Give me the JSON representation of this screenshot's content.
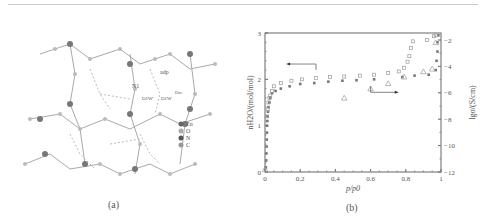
{
  "figure": {
    "panel_a": {
      "caption": "(a)",
      "labels": {
        "adp": "adp",
        "n1": "N1",
        "o1w_prime": "O1W'",
        "o1w": "O1W",
        "ow": "Ow"
      },
      "legend": [
        {
          "label": "Zn",
          "color": "#666"
        },
        {
          "label": "O",
          "color": "#aaa"
        },
        {
          "label": "N",
          "color": "#555"
        },
        {
          "label": "C",
          "color": "#999"
        }
      ]
    },
    "panel_b": {
      "caption": "(b)"
    }
  },
  "chart_data": {
    "type": "scatter",
    "title": "",
    "xlabel": "p/p0",
    "ylabel": "nH2O/(mol/mol)",
    "ylabel_right": "lgσ/(S/cm)",
    "xlim": [
      0,
      1
    ],
    "ylim": [
      0,
      3
    ],
    "ylim_right": [
      -12,
      -2
    ],
    "x_ticks": [
      "0",
      "0.2",
      "0.4",
      "0.6",
      "0.8",
      "1"
    ],
    "y_ticks": [
      "0",
      "1",
      "2",
      "3"
    ],
    "y_right_ticks": [
      "-2",
      "-4",
      "-6",
      "-8",
      "-10",
      "-12"
    ],
    "grid": false,
    "series": [
      {
        "name": "adsorption (filled squares)",
        "axis": "left",
        "marker": "filled-square",
        "x": [
          0.005,
          0.007,
          0.008,
          0.009,
          0.01,
          0.011,
          0.012,
          0.013,
          0.015,
          0.017,
          0.02,
          0.025,
          0.03,
          0.04,
          0.06,
          0.09,
          0.14,
          0.2,
          0.28,
          0.36,
          0.44,
          0.52,
          0.62,
          0.78,
          0.85,
          0.93,
          0.97,
          0.975,
          0.98,
          0.98,
          0.985
        ],
        "y": [
          0.1,
          0.25,
          0.4,
          0.55,
          0.7,
          0.85,
          1.0,
          1.1,
          1.2,
          1.3,
          1.4,
          1.5,
          1.6,
          1.7,
          1.75,
          1.8,
          1.85,
          1.9,
          1.92,
          1.95,
          1.97,
          1.98,
          2.0,
          2.05,
          2.08,
          2.1,
          2.2,
          2.4,
          2.6,
          2.8,
          2.95
        ]
      },
      {
        "name": "desorption (open squares)",
        "axis": "left",
        "marker": "open-square",
        "x": [
          0.01,
          0.015,
          0.02,
          0.025,
          0.03,
          0.04,
          0.05,
          0.09,
          0.15,
          0.21,
          0.29,
          0.37,
          0.45,
          0.54,
          0.62,
          0.7,
          0.76,
          0.79,
          0.81,
          0.82,
          0.83,
          0.84,
          0.92,
          0.96,
          0.97
        ],
        "y": [
          1.2,
          1.35,
          1.5,
          1.6,
          1.65,
          1.75,
          1.85,
          1.92,
          1.97,
          2.0,
          2.03,
          2.05,
          2.06,
          2.08,
          2.1,
          2.14,
          2.17,
          2.25,
          2.38,
          2.5,
          2.68,
          2.82,
          2.85,
          2.93,
          2.95
        ]
      },
      {
        "name": "conductivity (open triangles)",
        "axis": "right",
        "marker": "open-triangle",
        "x": [
          0.0,
          0.45,
          0.6,
          0.7,
          0.79,
          0.9,
          0.95,
          0.97
        ],
        "y": [
          -11.8,
          -6.4,
          -5.7,
          -5.3,
          -4.8,
          -4.4,
          -4.2,
          -2.2
        ]
      }
    ],
    "annotations": [
      {
        "text": "arrow pointing left (left axis series)",
        "x": 0.2,
        "y": 2.3
      },
      {
        "text": "arrow pointing right (right axis series)",
        "x": 0.7,
        "y": 1.6
      }
    ]
  }
}
